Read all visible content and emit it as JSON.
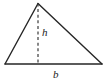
{
  "figure": {
    "name": "triangle-with-altitude",
    "canvas": {
      "width": 108,
      "height": 84,
      "background": "#ffffff"
    },
    "stroke": {
      "color": "#262626",
      "width": 1.4,
      "dash_color": "#3a3a3a",
      "dash_pattern": "3 2.6"
    },
    "vertices": {
      "apex": {
        "x": 38,
        "y": 3.5
      },
      "bottom_left": {
        "x": 5,
        "y": 64
      },
      "bottom_right": {
        "x": 102,
        "y": 64
      }
    },
    "altitude": {
      "from": {
        "x": 38,
        "y": 3.5
      },
      "to": {
        "x": 38,
        "y": 64
      },
      "style": "dashed"
    },
    "labels": {
      "height": "h",
      "base": "b"
    }
  }
}
